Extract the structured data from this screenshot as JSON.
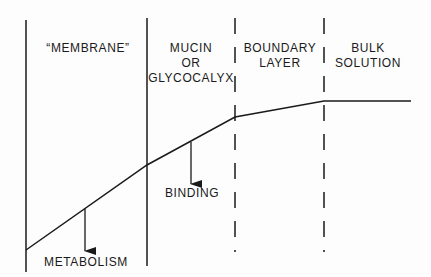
{
  "diagram": {
    "regions": [
      {
        "id": "membrane",
        "lines": [
          "“MEMBRANE”"
        ]
      },
      {
        "id": "mucin",
        "lines": [
          "MUCIN",
          "OR",
          "GLYCOCALYX"
        ]
      },
      {
        "id": "boundary",
        "lines": [
          "BOUNDARY",
          "LAYER"
        ]
      },
      {
        "id": "bulk",
        "lines": [
          "BULK",
          "SOLUTION"
        ]
      }
    ],
    "annotations": {
      "binding": "BINDING",
      "metabolism": "METABOLISM"
    },
    "dividers": [
      {
        "x": 26,
        "style": "solid"
      },
      {
        "x": 147,
        "style": "solid"
      },
      {
        "x": 235,
        "style": "dashed"
      },
      {
        "x": 324,
        "style": "dashed"
      }
    ],
    "concentration_profile": [
      [
        26,
        250
      ],
      [
        147,
        165
      ],
      [
        235,
        117
      ],
      [
        324,
        101
      ],
      [
        411,
        101
      ]
    ],
    "colors": {
      "line": "#1a1a1a",
      "background": "#fdfdfd"
    }
  }
}
